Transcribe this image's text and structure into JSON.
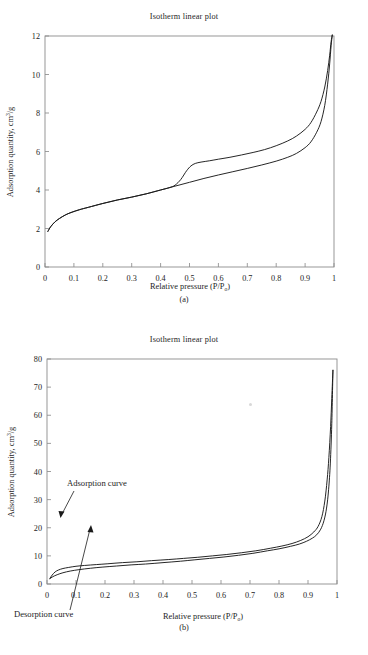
{
  "document": {
    "kind": "scientific-figure",
    "figure_caption_a": "(a)",
    "figure_caption_b": "(b)"
  },
  "chart_data": [
    {
      "id": "panel-a",
      "type": "line",
      "title": "Isotherm linear plot",
      "caption": "(a)",
      "xlabel": "Relative pressure (P/P",
      "xlabel_sub": "o",
      "xlabel_tail": ")",
      "ylabel_main": "Adsorption quantity, cm",
      "ylabel_sup": "3",
      "ylabel_tail": "/g",
      "xlim": [
        0,
        1
      ],
      "ylim": [
        0,
        12
      ],
      "xticks": [
        "0",
        "0.1",
        "0.2",
        "0.3",
        "0.4",
        "0.5",
        "0.6",
        "0.7",
        "0.8",
        "0.9",
        "1"
      ],
      "xtick_values": [
        0,
        0.1,
        0.2,
        0.3,
        0.4,
        0.5,
        0.6,
        0.7,
        0.8,
        0.9,
        1
      ],
      "yticks": [
        "0",
        "2",
        "4",
        "6",
        "8",
        "10",
        "12"
      ],
      "ytick_values": [
        0,
        2,
        4,
        6,
        8,
        10,
        12
      ],
      "grid": false,
      "legend": "none",
      "series": [
        {
          "name": "Adsorption curve",
          "x": [
            0.01,
            0.02,
            0.035,
            0.05,
            0.07,
            0.09,
            0.12,
            0.15,
            0.2,
            0.25,
            0.3,
            0.35,
            0.4,
            0.43,
            0.45,
            0.47,
            0.49,
            0.505,
            0.52,
            0.54,
            0.57,
            0.6,
            0.64,
            0.68,
            0.72,
            0.76,
            0.8,
            0.84,
            0.87,
            0.9,
            0.92,
            0.94,
            0.955,
            0.968,
            0.978,
            0.985,
            0.99,
            0.994
          ],
          "y": [
            1.85,
            2.1,
            2.35,
            2.52,
            2.7,
            2.83,
            2.98,
            3.1,
            3.3,
            3.48,
            3.63,
            3.8,
            4.0,
            4.12,
            4.25,
            4.55,
            5.0,
            5.25,
            5.38,
            5.45,
            5.52,
            5.6,
            5.7,
            5.82,
            5.95,
            6.1,
            6.3,
            6.55,
            6.8,
            7.15,
            7.5,
            8.05,
            8.6,
            9.35,
            10.2,
            11.0,
            11.7,
            12.05
          ]
        },
        {
          "name": "Desorption curve",
          "x": [
            0.01,
            0.02,
            0.035,
            0.05,
            0.07,
            0.09,
            0.12,
            0.15,
            0.2,
            0.25,
            0.3,
            0.35,
            0.4,
            0.45,
            0.5,
            0.55,
            0.6,
            0.65,
            0.7,
            0.75,
            0.8,
            0.84,
            0.87,
            0.9,
            0.92,
            0.94,
            0.955,
            0.968,
            0.978,
            0.985,
            0.99,
            0.994
          ],
          "y": [
            1.85,
            2.1,
            2.35,
            2.52,
            2.7,
            2.83,
            2.98,
            3.1,
            3.3,
            3.48,
            3.63,
            3.8,
            4.0,
            4.2,
            4.4,
            4.6,
            4.78,
            4.95,
            5.12,
            5.3,
            5.5,
            5.7,
            5.9,
            6.2,
            6.5,
            7.0,
            7.55,
            8.4,
            9.5,
            10.55,
            11.5,
            12.05
          ]
        }
      ]
    },
    {
      "id": "panel-b",
      "type": "line",
      "title": "Isotherm linear plot",
      "caption": "(b)",
      "xlabel": "Relative pressure (P/P",
      "xlabel_sub": "o",
      "xlabel_tail": ")",
      "ylabel_main": "Adsorption quantity, cm",
      "ylabel_sup": "3",
      "ylabel_tail": "/g",
      "xlim": [
        0,
        1
      ],
      "ylim": [
        0,
        80
      ],
      "xticks": [
        "0",
        "0.1",
        "0.2",
        "0.3",
        "0.4",
        "0.5",
        "0.6",
        "0.7",
        "0.8",
        "0.9",
        "1"
      ],
      "xtick_values": [
        0,
        0.1,
        0.2,
        0.3,
        0.4,
        0.5,
        0.6,
        0.7,
        0.8,
        0.9,
        1
      ],
      "yticks": [
        "0",
        "10",
        "20",
        "30",
        "40",
        "50",
        "60",
        "70",
        "80"
      ],
      "ytick_values": [
        0,
        10,
        20,
        30,
        40,
        50,
        60,
        70,
        80
      ],
      "grid": false,
      "legend": "annotations",
      "annotations": [
        {
          "text": "Adsorption curve",
          "points_to": "upper-curve"
        },
        {
          "text": "Desorption curve",
          "points_to": "lower-curve"
        }
      ],
      "series": [
        {
          "name": "Adsorption curve",
          "x": [
            0.01,
            0.018,
            0.028,
            0.04,
            0.055,
            0.075,
            0.1,
            0.13,
            0.17,
            0.21,
            0.26,
            0.31,
            0.36,
            0.42,
            0.47,
            0.52,
            0.57,
            0.62,
            0.67,
            0.72,
            0.77,
            0.81,
            0.845,
            0.875,
            0.9,
            0.92,
            0.935,
            0.948,
            0.958,
            0.966,
            0.972,
            0.978,
            0.982,
            0.986
          ],
          "y": [
            2.0,
            3.2,
            4.3,
            5.0,
            5.5,
            5.9,
            6.3,
            6.6,
            6.9,
            7.2,
            7.6,
            7.9,
            8.3,
            8.7,
            9.1,
            9.5,
            10.0,
            10.5,
            11.1,
            11.8,
            12.7,
            13.5,
            14.4,
            15.5,
            16.8,
            18.5,
            20.5,
            24.0,
            29.5,
            37.0,
            45.0,
            56.0,
            66.0,
            76.0
          ]
        },
        {
          "name": "Desorption curve",
          "x": [
            0.01,
            0.02,
            0.035,
            0.055,
            0.08,
            0.11,
            0.15,
            0.19,
            0.24,
            0.29,
            0.34,
            0.4,
            0.46,
            0.51,
            0.56,
            0.61,
            0.66,
            0.71,
            0.76,
            0.8,
            0.84,
            0.87,
            0.895,
            0.915,
            0.93,
            0.944,
            0.955,
            0.964,
            0.971,
            0.977,
            0.982,
            0.986
          ],
          "y": [
            1.9,
            2.6,
            3.3,
            4.0,
            4.6,
            5.1,
            5.6,
            6.0,
            6.4,
            6.8,
            7.1,
            7.6,
            8.1,
            8.6,
            9.1,
            9.6,
            10.2,
            10.9,
            11.8,
            12.5,
            13.4,
            14.2,
            15.2,
            16.3,
            17.5,
            19.5,
            22.5,
            27.0,
            33.5,
            43.0,
            57.0,
            76.0
          ]
        }
      ]
    }
  ]
}
